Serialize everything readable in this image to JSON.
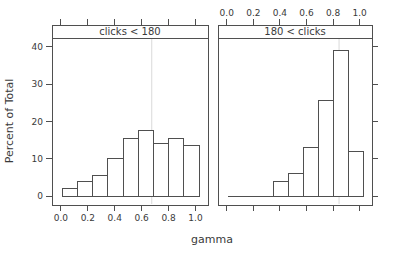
{
  "chart_data": {
    "type": "histogram",
    "title": "",
    "xlabel": "gamma",
    "ylabel": "Percent of Total",
    "x_domain": [
      -0.066,
      1.093
    ],
    "y_domain": [
      -2.4,
      42.4
    ],
    "x_ticks": [
      0.0,
      0.2,
      0.4,
      0.6,
      0.8,
      1.0
    ],
    "x_tick_labels": [
      "0.0",
      "0.2",
      "0.4",
      "0.6",
      "0.8",
      "1.0"
    ],
    "y_ticks": [
      0,
      10,
      20,
      30,
      40
    ],
    "y_tick_labels": [
      "0",
      "10",
      "20",
      "30",
      "40"
    ],
    "bins": {
      "start": 0.01,
      "width": 0.113,
      "count": 9
    },
    "panels": [
      {
        "strip_label": "clicks < 180",
        "x_labels_side": "bottom",
        "first_bin": 0,
        "values": [
          2,
          4,
          5.5,
          10,
          15.5,
          17.5,
          14,
          15.5,
          13.5
        ],
        "ref_line_x": 0.675
      },
      {
        "strip_label": "180 < clicks",
        "x_labels_side": "top",
        "first_bin": 3,
        "values": [
          4,
          6,
          13,
          25.5,
          39,
          12
        ],
        "ref_line_x": 0.845
      }
    ],
    "legend": null,
    "grid": false,
    "colors": {
      "bar_fill": "#ffffff",
      "stroke": "#4f4f4f",
      "text": "#3a3a3a",
      "ref_line": "#d9d9d9",
      "strip_fill": "#fefefe",
      "panel_fill": "#ffffff"
    }
  }
}
